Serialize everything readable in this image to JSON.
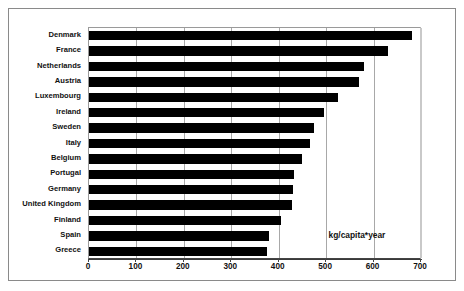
{
  "chart_data": {
    "type": "bar",
    "orientation": "horizontal",
    "title": "",
    "xlabel": "",
    "ylabel": "",
    "categories": [
      "Denmark",
      "France",
      "Netherlands",
      "Austria",
      "Luxembourg",
      "Ireland",
      "Sweden",
      "Italy",
      "Belgium",
      "Portugal",
      "Germany",
      "United Kingdom",
      "Finland",
      "Spain",
      "Greece"
    ],
    "values": [
      680,
      630,
      580,
      570,
      525,
      495,
      475,
      465,
      450,
      432,
      430,
      428,
      405,
      380,
      375
    ],
    "xlim": [
      0,
      700
    ],
    "xticks": [
      0,
      100,
      200,
      300,
      400,
      500,
      600,
      700
    ],
    "xtick_labels": [
      "0",
      "100",
      "200",
      "300",
      "400",
      "500",
      "600",
      "700"
    ],
    "grid": true,
    "legend": false,
    "annotations": [
      {
        "text": "kg/capita*year",
        "x": 600,
        "category_index": 13
      }
    ],
    "bar_color": "#000000",
    "background_color": "#ffffff",
    "gridline_color": "#a8a8a8"
  },
  "units_label": "kg/capita*year"
}
